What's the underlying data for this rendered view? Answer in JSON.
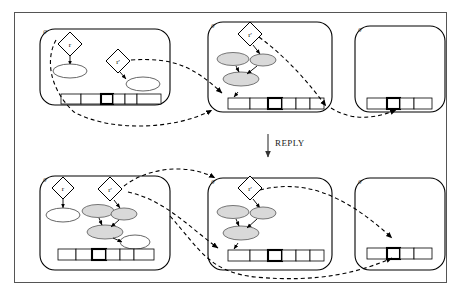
{
  "figure": {
    "title": "",
    "transition_label": "REPLY",
    "background_color": "#ffffff",
    "frame_color": "#555555",
    "shaded_node_color": "#d9d9d9",
    "line_color": "#000000"
  },
  "rows": [
    {
      "row_name": "before-reply",
      "panels": [
        {
          "panel_name": "top-left-process",
          "corner_label": "g",
          "diamonds": [
            {
              "label": "r"
            },
            {
              "label": "r'"
            }
          ],
          "ellipses": [
            {
              "shade": "white"
            },
            {
              "shade": "white"
            }
          ],
          "tape": {
            "cells": 6,
            "active_index": 2
          }
        },
        {
          "panel_name": "top-middle-process",
          "corner_label": "g",
          "diamonds": [
            {
              "label": "r'"
            }
          ],
          "ellipses": [
            {
              "shade": "shaded"
            },
            {
              "shade": "shaded"
            },
            {
              "shade": "shaded"
            }
          ],
          "tape": {
            "cells": 6,
            "active_index": 2
          }
        },
        {
          "panel_name": "top-right-process",
          "corner_label": "g",
          "diamonds": [],
          "ellipses": [],
          "tape": {
            "cells": 4,
            "active_index": 1
          }
        }
      ]
    },
    {
      "row_name": "after-reply",
      "panels": [
        {
          "panel_name": "bottom-left-process",
          "corner_label": "g",
          "diamonds": [
            {
              "label": "r"
            },
            {
              "label": "r'"
            }
          ],
          "ellipses": [
            {
              "shade": "white"
            },
            {
              "shade": "shaded"
            },
            {
              "shade": "shaded"
            },
            {
              "shade": "shaded"
            },
            {
              "shade": "white"
            }
          ],
          "tape": {
            "cells": 6,
            "active_index": 2
          }
        },
        {
          "panel_name": "bottom-middle-process",
          "corner_label": "g",
          "diamonds": [
            {
              "label": "r'"
            }
          ],
          "ellipses": [
            {
              "shade": "shaded"
            },
            {
              "shade": "shaded"
            },
            {
              "shade": "shaded"
            }
          ],
          "tape": {
            "cells": 6,
            "active_index": 2
          }
        },
        {
          "panel_name": "bottom-right-process",
          "corner_label": "g",
          "diamonds": [],
          "ellipses": [],
          "tape": {
            "cells": 4,
            "active_index": 1
          }
        }
      ]
    }
  ]
}
